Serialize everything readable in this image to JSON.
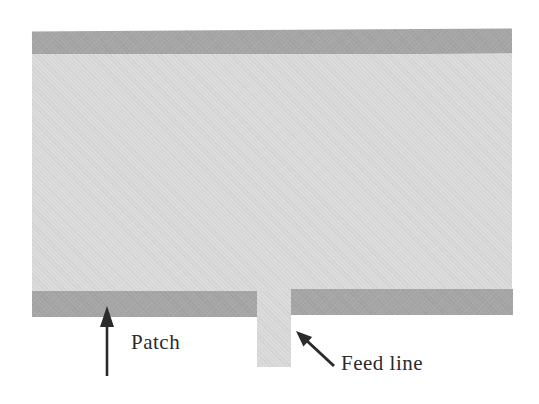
{
  "figure": {
    "labels": {
      "patch": "Patch",
      "feed_line": "Feed line"
    },
    "colors": {
      "page_bg": "#ffffff",
      "patch_fill": "#dbdbdb",
      "band_fill": "#a7a7a7",
      "ink": "#2b2b2b"
    }
  }
}
